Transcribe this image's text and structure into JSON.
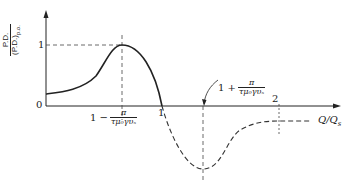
{
  "diagram": {
    "y_axis": {
      "label_numerator": "P.D.",
      "label_denominator": "(P.D.)",
      "label_subscript": "p.o.",
      "ticks": [
        "0",
        "1"
      ]
    },
    "x_axis": {
      "label": "Q/Q",
      "label_subscript": "s",
      "ticks": [
        "1",
        "2"
      ]
    },
    "annotations": {
      "left_marker": {
        "prefix": "1 −",
        "numerator": "π",
        "denominator": "τμ₀γυₛ"
      },
      "right_marker": {
        "prefix": "1 +",
        "numerator": "π",
        "denominator": "τμ₀γυₛ"
      }
    },
    "colors": {
      "line": "#222222",
      "background": "#ffffff"
    }
  }
}
